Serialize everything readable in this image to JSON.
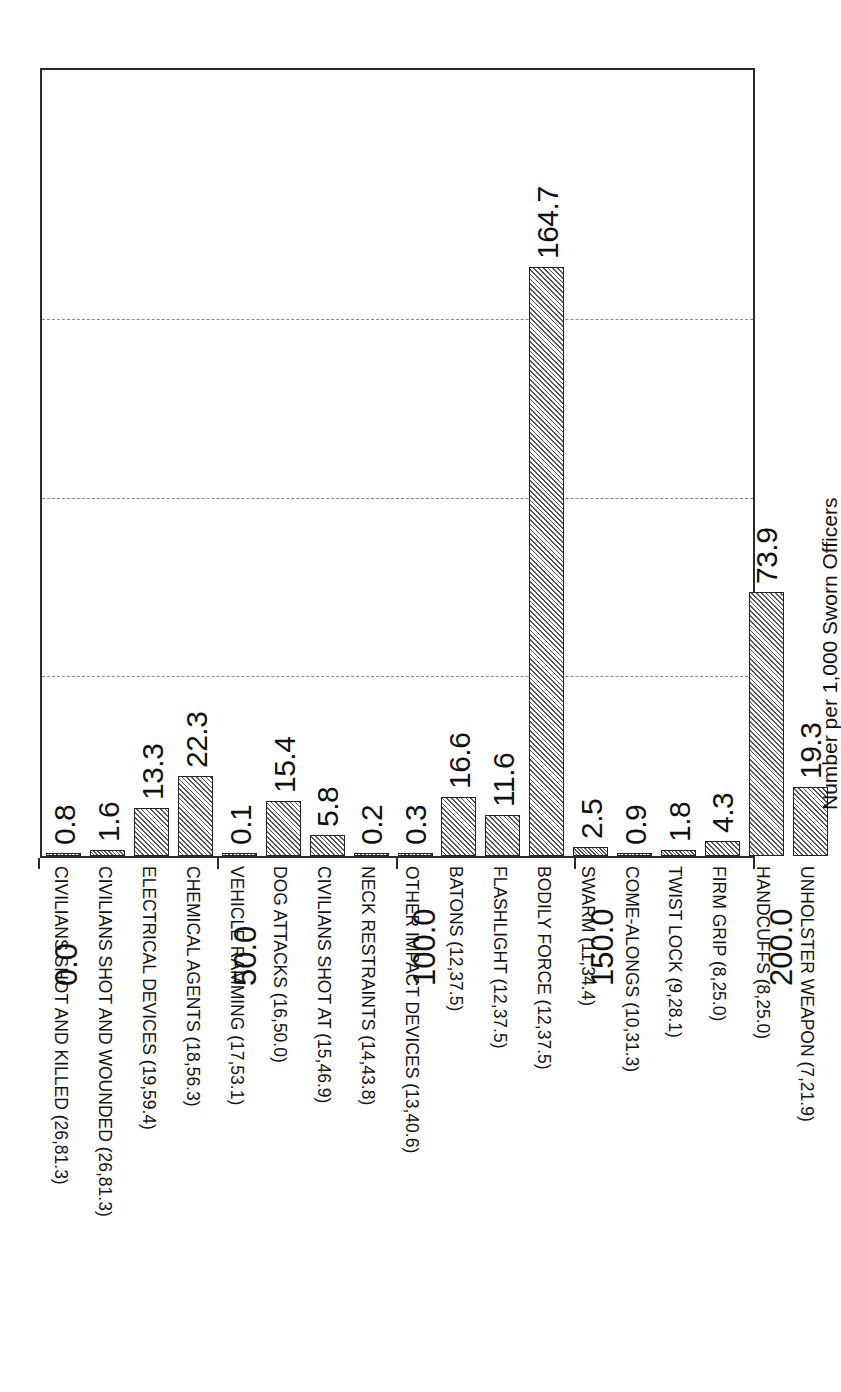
{
  "chart_data": {
    "type": "bar",
    "orientation": "vertical-bars-rotated-page",
    "title": "",
    "xlabel": "",
    "ylabel": "Number per 1,000 Sworn Officers",
    "ylim": [
      0.0,
      200.0
    ],
    "yticks": [
      "0.0",
      "50.0",
      "100.0",
      "150.0",
      "200.0"
    ],
    "ytick_values": [
      0,
      50,
      100,
      150,
      200
    ],
    "grid": "dashed gridlines at 50.0, 100.0, 150.0",
    "legend": "none",
    "bar_fill": "diagonal hatch",
    "categories": [
      "CIVILIANS SHOT AND KILLED (26,81.3)",
      "CIVILIANS SHOT AND WOUNDED (26,81.3)",
      "ELECTRICAL DEVICES (19,59.4)",
      "CHEMICAL AGENTS (18,56.3)",
      "VEHICLE RAMMING (17,53.1)",
      "DOG ATTACKS (16,50.0)",
      "CIVILIANS SHOT AT (15,46.9)",
      "NECK RESTRAINTS (14,43.8)",
      "OTHER IMPACT DEVICES (13,40.6)",
      "BATONS (12,37.5)",
      "FLASHLIGHT (12,37.5)",
      "BODILY FORCE (12,37.5)",
      "SWARM (11,34.4)",
      "COME-ALONGS (10,31.3)",
      "TWIST LOCK (9,28.1)",
      "FIRM GRIP (8,25.0)",
      "HANDCUFFS (8,25.0)",
      "UNHOLSTER WEAPON (7,21.9)"
    ],
    "values": [
      0.8,
      1.6,
      13.3,
      22.3,
      0.1,
      15.4,
      5.8,
      0.2,
      0.3,
      16.6,
      11.6,
      164.7,
      2.5,
      0.9,
      1.8,
      4.3,
      73.9,
      19.3
    ],
    "value_labels": [
      "0.8",
      "1.6",
      "13.3",
      "22.3",
      "0.1",
      "15.4",
      "5.8",
      "0.2",
      "0.3",
      "16.6",
      "11.6",
      "164.7",
      "2.5",
      "0.9",
      "1.8",
      "4.3",
      "73.9",
      "19.3"
    ]
  },
  "colors": {
    "axis": "#2b2b2b",
    "grid": "#8a8a8a",
    "bar_border": "#222222",
    "bar_hatch": "#555555",
    "background": "#ffffff",
    "text": "#111111"
  }
}
